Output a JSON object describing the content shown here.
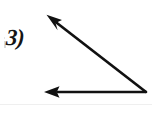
{
  "figure": {
    "problem_label": "3)",
    "type": "angle-diagram",
    "stroke_color": "#111111",
    "background_color": "#ffffff",
    "stroke_width": 2.6,
    "vertex": {
      "x": 146,
      "y": 92,
      "name": "angle-vertex"
    },
    "rays": [
      {
        "name": "ray-upper-left",
        "from": {
          "x": 146,
          "y": 92
        },
        "to": {
          "x": 48,
          "y": 16
        },
        "arrowhead": "at-end",
        "direction": "up-left"
      },
      {
        "name": "ray-horizontal-left",
        "from": {
          "x": 146,
          "y": 92
        },
        "to": {
          "x": 45,
          "y": 92
        },
        "arrowhead": "at-end",
        "direction": "left"
      }
    ],
    "arrowhead": {
      "length": 15,
      "half_width": 5.5
    }
  }
}
